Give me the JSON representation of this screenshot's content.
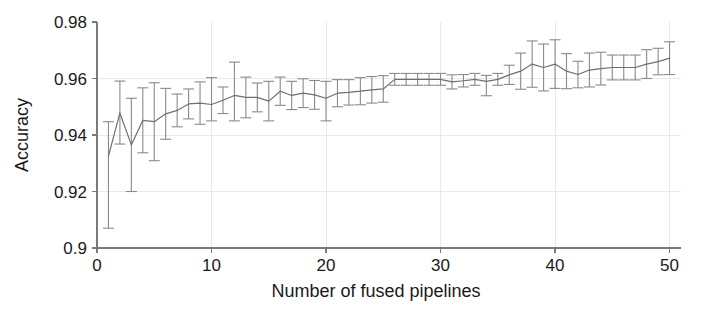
{
  "chart_data": {
    "type": "line",
    "title": "",
    "xlabel": "Number of fused pipelines",
    "ylabel": "Accuracy",
    "xlim": [
      0,
      51
    ],
    "ylim": [
      0.9,
      0.98
    ],
    "grid": true,
    "legend": null,
    "xticks": [
      0,
      10,
      20,
      30,
      40,
      50
    ],
    "xticklabels": [
      "0",
      "10",
      "20",
      "30",
      "40",
      "50"
    ],
    "yticks": [
      0.9,
      0.92,
      0.94,
      0.96,
      0.98
    ],
    "yticklabels": [
      "0.9",
      "0.92",
      "0.94",
      "0.96",
      "0.98"
    ],
    "series": [
      {
        "name": "Accuracy",
        "marker": "none",
        "errorbars": true,
        "x": [
          1,
          2,
          3,
          4,
          5,
          6,
          7,
          8,
          9,
          10,
          11,
          12,
          13,
          14,
          15,
          16,
          17,
          18,
          19,
          20,
          21,
          22,
          23,
          24,
          25,
          26,
          27,
          28,
          29,
          30,
          31,
          32,
          33,
          34,
          35,
          36,
          37,
          38,
          39,
          40,
          41,
          42,
          43,
          44,
          45,
          46,
          47,
          48,
          49,
          50
        ],
        "values": [
          0.9325,
          0.9478,
          0.9365,
          0.9452,
          0.9447,
          0.9475,
          0.9487,
          0.951,
          0.9513,
          0.9508,
          0.9523,
          0.954,
          0.9533,
          0.9533,
          0.952,
          0.9555,
          0.954,
          0.9548,
          0.9542,
          0.953,
          0.9548,
          0.9551,
          0.9555,
          0.956,
          0.9563,
          0.9597,
          0.9597,
          0.9597,
          0.9597,
          0.9597,
          0.9588,
          0.9592,
          0.9597,
          0.959,
          0.9597,
          0.9613,
          0.9626,
          0.9651,
          0.9639,
          0.9651,
          0.9626,
          0.9614,
          0.963,
          0.9635,
          0.9639,
          0.9639,
          0.9639,
          0.9651,
          0.966,
          0.9672
        ],
        "err_lower": [
          0.0255,
          0.011,
          0.0165,
          0.0115,
          0.0138,
          0.009,
          0.0058,
          0.0053,
          0.0075,
          0.0058,
          0.0047,
          0.009,
          0.0072,
          0.0051,
          0.007,
          0.005,
          0.005,
          0.0051,
          0.0051,
          0.008,
          0.0048,
          0.0045,
          0.0048,
          0.0047,
          0.0047,
          0.0021,
          0.0021,
          0.0021,
          0.0021,
          0.0021,
          0.0025,
          0.0022,
          0.0021,
          0.0051,
          0.0021,
          0.0034,
          0.0064,
          0.0082,
          0.0083,
          0.0086,
          0.0062,
          0.0047,
          0.006,
          0.0058,
          0.0044,
          0.0044,
          0.0044,
          0.0051,
          0.0047,
          0.0058
        ],
        "err_upper": [
          0.0122,
          0.0113,
          0.0165,
          0.0115,
          0.0138,
          0.009,
          0.0058,
          0.0053,
          0.0075,
          0.0095,
          0.0047,
          0.0118,
          0.0072,
          0.0051,
          0.007,
          0.005,
          0.005,
          0.0051,
          0.0051,
          0.006,
          0.0048,
          0.0045,
          0.0048,
          0.0047,
          0.0047,
          0.0021,
          0.0021,
          0.0021,
          0.0021,
          0.0021,
          0.0025,
          0.0022,
          0.0021,
          0.0021,
          0.0021,
          0.0034,
          0.0064,
          0.0082,
          0.0083,
          0.0086,
          0.0062,
          0.0047,
          0.006,
          0.0058,
          0.0044,
          0.0044,
          0.0044,
          0.0051,
          0.0047,
          0.0058
        ],
        "color": "#6f6f6f",
        "errorbar_color": "#8a8a8a"
      }
    ]
  },
  "colors": {
    "background": "#ffffff",
    "line": "#6f6f6f",
    "errorbar": "#8a8a8a",
    "grid": "#e9e9e9",
    "axis": "#7a7a7a",
    "text": "#1a1a1a"
  }
}
